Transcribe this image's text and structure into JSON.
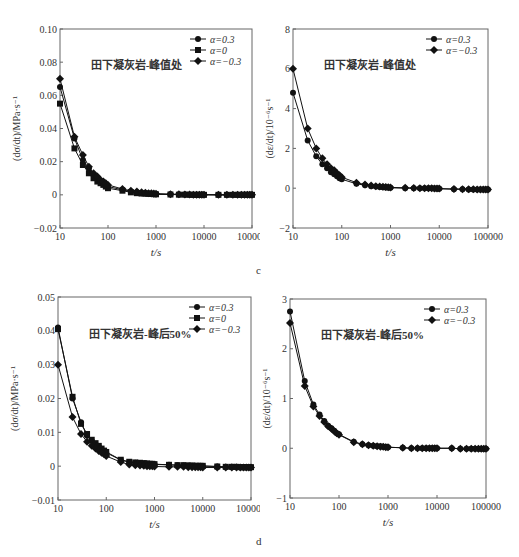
{
  "figure": {
    "sublabels": [
      "c",
      "d"
    ]
  },
  "chart_data": [
    {
      "id": "c-left",
      "type": "line",
      "note": "Series values are approximate, estimated from the curve shapes; exact data not recoverable from the image",
      "annotation": "田下凝灰岩-峰值处",
      "xlabel": "t/s",
      "ylabel": "(dσ/dt)/MPa·s⁻¹",
      "xscale": "log",
      "xlim": [
        10,
        100000
      ],
      "ylim": [
        -0.02,
        0.1
      ],
      "xticks": [
        "10",
        "100",
        "1000",
        "10000",
        "100000"
      ],
      "yticks": [
        "-0.02",
        "0",
        "0.02",
        "0.04",
        "0.06",
        "0.08",
        "0.10"
      ],
      "legend": [
        "α=0.3",
        "α=0",
        "α=−0.3"
      ],
      "legend_position": "upper right",
      "x": [
        10,
        20,
        30,
        40,
        50,
        60,
        70,
        80,
        90,
        100,
        200,
        300,
        400,
        500,
        600,
        700,
        800,
        900,
        1000,
        2000,
        3000,
        4000,
        5000,
        6000,
        7000,
        8000,
        9000,
        10000,
        20000,
        30000,
        40000,
        50000,
        60000,
        70000,
        80000,
        90000,
        100000
      ],
      "series": [
        {
          "name": "α=0.3",
          "marker": "circle",
          "values": [
            0.065,
            0.034,
            0.021,
            0.016,
            0.012,
            0.01,
            0.008,
            0.007,
            0.006,
            0.005,
            0.003,
            0.002,
            0.0015,
            0.001,
            0.001,
            0.0008,
            0.0007,
            0.0006,
            0.0005,
            0.0003,
            0.0002,
            0.0002,
            0.0001,
            0.0001,
            0.0001,
            0.0001,
            0.0001,
            0.0001,
            0.0,
            0.0,
            0.0,
            0.0,
            0.0,
            0.0,
            0.0,
            0.0,
            0.0
          ]
        },
        {
          "name": "α=0",
          "marker": "square",
          "values": [
            0.055,
            0.028,
            0.018,
            0.013,
            0.01,
            0.008,
            0.007,
            0.006,
            0.005,
            0.004,
            0.0025,
            0.0015,
            0.001,
            0.0008,
            0.0007,
            0.0006,
            0.0005,
            0.0004,
            0.0003,
            0.0002,
            0.0001,
            0.0001,
            0.0001,
            0.0,
            0.0,
            0.0,
            0.0,
            0.0,
            0.0,
            0.0,
            0.0,
            0.0,
            0.0,
            0.0,
            0.0,
            0.0,
            0.0
          ]
        },
        {
          "name": "α=−0.3",
          "marker": "diamond",
          "values": [
            0.07,
            0.035,
            0.024,
            0.017,
            0.013,
            0.011,
            0.009,
            0.008,
            0.007,
            0.006,
            0.0035,
            0.0025,
            0.002,
            0.0015,
            0.0012,
            0.001,
            0.0009,
            0.0008,
            0.0007,
            0.0004,
            0.0003,
            0.0002,
            0.0002,
            0.0001,
            0.0001,
            0.0001,
            0.0001,
            0.0001,
            0.0,
            0.0,
            0.0,
            0.0,
            0.0,
            0.0,
            0.0,
            0.0,
            0.0
          ]
        }
      ]
    },
    {
      "id": "c-right",
      "type": "line",
      "note": "Series values are approximate, estimated from the curve shapes; exact data not recoverable from the image",
      "annotation": "田下凝灰岩-峰值处",
      "xlabel": "t/s",
      "ylabel": "(dε/dt)/10⁻⁶s⁻¹",
      "xscale": "log",
      "xlim": [
        10,
        100000
      ],
      "ylim": [
        -2,
        8
      ],
      "xticks": [
        "10",
        "100",
        "1000",
        "10000",
        "100000"
      ],
      "yticks": [
        "-2",
        "0",
        "2",
        "4",
        "6",
        "8"
      ],
      "legend": [
        "α=0.3",
        "α=−0.3"
      ],
      "legend_position": "upper right",
      "x": [
        10,
        20,
        30,
        40,
        50,
        60,
        70,
        80,
        90,
        100,
        200,
        300,
        400,
        500,
        600,
        700,
        800,
        900,
        1000,
        2000,
        3000,
        4000,
        5000,
        6000,
        7000,
        8000,
        9000,
        10000,
        20000,
        30000,
        40000,
        50000,
        60000,
        70000,
        80000,
        90000,
        100000
      ],
      "series": [
        {
          "name": "α=0.3",
          "marker": "circle",
          "values": [
            4.8,
            2.4,
            1.6,
            1.2,
            1.0,
            0.8,
            0.7,
            0.6,
            0.5,
            0.45,
            0.22,
            0.15,
            0.1,
            0.08,
            0.06,
            0.05,
            0.04,
            0.03,
            0.02,
            0.0,
            0.0,
            0.0,
            0.0,
            0.0,
            0.0,
            -0.02,
            -0.02,
            -0.03,
            -0.05,
            -0.05,
            -0.06,
            -0.06,
            -0.06,
            -0.07,
            -0.07,
            -0.07,
            -0.07
          ]
        },
        {
          "name": "α=−0.3",
          "marker": "diamond",
          "values": [
            6.0,
            3.0,
            2.0,
            1.5,
            1.2,
            1.0,
            0.9,
            0.75,
            0.65,
            0.55,
            0.28,
            0.18,
            0.13,
            0.1,
            0.08,
            0.07,
            0.06,
            0.05,
            0.04,
            0.02,
            0.01,
            0.0,
            0.0,
            0.0,
            0.0,
            -0.01,
            -0.01,
            -0.02,
            -0.04,
            -0.05,
            -0.05,
            -0.05,
            -0.06,
            -0.06,
            -0.06,
            -0.06,
            -0.06
          ]
        }
      ]
    },
    {
      "id": "d-left",
      "type": "line",
      "note": "Series values are approximate, estimated from the curve shapes; exact data not recoverable from the image",
      "annotation": "田下凝灰岩-峰后50%",
      "xlabel": "t/s",
      "ylabel": "(dσ/dt)/MPa·s⁻¹",
      "xscale": "log",
      "xlim": [
        10,
        100000
      ],
      "ylim": [
        -0.01,
        0.05
      ],
      "xticks": [
        "10",
        "100",
        "1000",
        "10000",
        "100000"
      ],
      "yticks": [
        "-0.01",
        "0",
        "0.01",
        "0.02",
        "0.03",
        "0.04",
        "0.05"
      ],
      "legend": [
        "α=0.3",
        "α=0",
        "α=−0.3"
      ],
      "legend_position": "upper right",
      "x": [
        10,
        20,
        30,
        40,
        50,
        60,
        70,
        80,
        90,
        100,
        200,
        300,
        400,
        500,
        600,
        700,
        800,
        900,
        1000,
        2000,
        3000,
        4000,
        5000,
        6000,
        7000,
        8000,
        9000,
        10000,
        20000,
        30000,
        40000,
        50000,
        60000,
        70000,
        80000,
        90000,
        100000
      ],
      "series": [
        {
          "name": "α=0.3",
          "marker": "circle",
          "values": [
            0.041,
            0.02,
            0.013,
            0.009,
            0.0075,
            0.0065,
            0.0058,
            0.005,
            0.0045,
            0.004,
            0.0018,
            0.0012,
            0.001,
            0.0009,
            0.0008,
            0.0007,
            0.0006,
            0.0006,
            0.0005,
            0.0004,
            0.0003,
            0.0002,
            0.0002,
            0.0001,
            0.0001,
            0.0001,
            0.0,
            0.0,
            -0.0001,
            -0.0002,
            -0.0002,
            -0.0002,
            -0.0003,
            -0.0003,
            -0.0003,
            -0.0003,
            -0.0003
          ]
        },
        {
          "name": "α=0",
          "marker": "square",
          "values": [
            0.0405,
            0.0205,
            0.0125,
            0.0095,
            0.0078,
            0.0068,
            0.006,
            0.0052,
            0.0046,
            0.0042,
            0.0019,
            0.0013,
            0.0011,
            0.001,
            0.0009,
            0.0008,
            0.0007,
            0.0007,
            0.0006,
            0.0004,
            0.0003,
            0.0003,
            0.0002,
            0.0002,
            0.0001,
            0.0001,
            0.0001,
            0.0001,
            -0.0001,
            -0.0002,
            -0.0002,
            -0.0002,
            -0.0003,
            -0.0003,
            -0.0003,
            -0.0003,
            -0.0003
          ]
        },
        {
          "name": "α=−0.3",
          "marker": "diamond",
          "values": [
            0.03,
            0.0145,
            0.0095,
            0.0072,
            0.006,
            0.0052,
            0.0045,
            0.004,
            0.0035,
            0.003,
            0.0012,
            0.0005,
            0.0003,
            0.0002,
            0.0001,
            0.0,
            0.0,
            0.0,
            -0.0001,
            -0.0002,
            -0.0002,
            -0.0002,
            -0.0003,
            -0.0003,
            -0.0003,
            -0.0003,
            -0.0003,
            -0.0004,
            -0.0004,
            -0.0004,
            -0.0004,
            -0.0004,
            -0.0004,
            -0.0004,
            -0.0004,
            -0.0004,
            -0.0004
          ]
        }
      ]
    },
    {
      "id": "d-right",
      "type": "line",
      "note": "Series values are approximate, estimated from the curve shapes; exact data not recoverable from the image",
      "annotation": "田下凝灰岩-峰后50%",
      "xlabel": "t/s",
      "ylabel": "(dε/dt)/10⁻⁶s⁻¹",
      "xscale": "log",
      "xlim": [
        10,
        100000
      ],
      "ylim": [
        -1,
        3
      ],
      "xticks": [
        "10",
        "100",
        "1000",
        "10000",
        "100000"
      ],
      "yticks": [
        "-1",
        "0",
        "1",
        "2",
        "3"
      ],
      "legend": [
        "α=0.3",
        "α=−0.3"
      ],
      "legend_position": "upper right",
      "x": [
        10,
        20,
        30,
        40,
        50,
        60,
        70,
        80,
        90,
        100,
        200,
        300,
        400,
        500,
        600,
        700,
        800,
        900,
        1000,
        2000,
        3000,
        4000,
        5000,
        6000,
        7000,
        8000,
        9000,
        10000,
        20000,
        30000,
        40000,
        50000,
        60000,
        70000,
        80000,
        90000,
        100000
      ],
      "series": [
        {
          "name": "α=0.3",
          "marker": "circle",
          "values": [
            2.75,
            1.35,
            0.88,
            0.68,
            0.55,
            0.45,
            0.4,
            0.35,
            0.3,
            0.28,
            0.13,
            0.08,
            0.06,
            0.05,
            0.04,
            0.04,
            0.03,
            0.03,
            0.02,
            0.01,
            0.0,
            0.0,
            0.0,
            0.0,
            0.0,
            0.0,
            0.0,
            0.0,
            0.0,
            -0.01,
            -0.01,
            -0.01,
            -0.01,
            -0.01,
            -0.01,
            -0.01,
            -0.01
          ]
        },
        {
          "name": "α=−0.3",
          "marker": "diamond",
          "values": [
            2.52,
            1.25,
            0.84,
            0.65,
            0.53,
            0.44,
            0.39,
            0.34,
            0.3,
            0.27,
            0.12,
            0.08,
            0.06,
            0.05,
            0.04,
            0.03,
            0.03,
            0.02,
            0.02,
            0.01,
            0.0,
            0.0,
            0.0,
            0.0,
            0.0,
            0.0,
            0.0,
            0.0,
            0.0,
            -0.01,
            -0.01,
            -0.01,
            -0.01,
            -0.01,
            -0.01,
            -0.01,
            -0.01
          ]
        }
      ]
    }
  ]
}
